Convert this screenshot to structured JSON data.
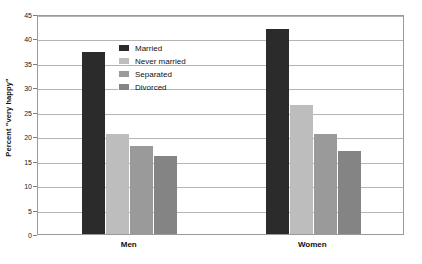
{
  "chart_data": {
    "type": "bar",
    "title": "",
    "subtitle": "",
    "xlabel": "",
    "ylabel": "Percent \"very happy\"",
    "categories": [
      "Men",
      "Women"
    ],
    "series": [
      {
        "name": "Married",
        "color": "#2b2b2b",
        "values": [
          37.3,
          42.0
        ]
      },
      {
        "name": "Never married",
        "color": "#bdbdbd",
        "values": [
          20.5,
          26.3
        ]
      },
      {
        "name": "Separated",
        "color": "#9a9a9a",
        "values": [
          18.0,
          20.5
        ]
      },
      {
        "name": "Divorced",
        "color": "#848484",
        "values": [
          16.0,
          17.0
        ]
      }
    ],
    "ylim": [
      0,
      45
    ],
    "yticks": [
      0,
      5,
      10,
      15,
      20,
      25,
      30,
      35,
      40,
      45
    ],
    "ytick_labels": [
      "0",
      "5",
      "10",
      "15",
      "20",
      "25",
      "30",
      "35",
      "40",
      "45"
    ],
    "grid": true,
    "grid_axis": "y",
    "legend_position": "inside-upper-left",
    "legend": [
      "Married",
      "Never married",
      "Separated",
      "Divorced"
    ]
  },
  "axes": {
    "y_title": "Percent \"very happy\""
  },
  "groups": [
    {
      "label": "Men"
    },
    {
      "label": "Women"
    }
  ]
}
